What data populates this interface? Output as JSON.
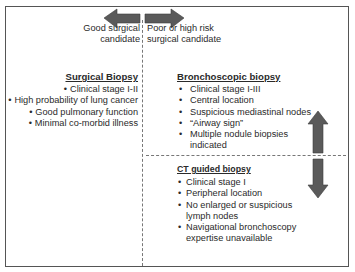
{
  "diagram": {
    "top_axis": {
      "left_label": "Good surgical candidate",
      "left_label_lines": [
        "Good surgical",
        "candidate"
      ],
      "right_label": "Poor or high risk surgical candidate",
      "right_label_lines": [
        "Poor or high risk",
        "surgical candidate"
      ],
      "arrow": "double-headed-horizontal"
    },
    "sections": {
      "surgical": {
        "title": "Surgical Biopsy",
        "items": [
          "Clinical stage I-II",
          "High probability of lung cancer",
          "Good pulmonary function",
          "Minimal co-morbid illness"
        ]
      },
      "bronchoscopic": {
        "title": "Bronchoscopic biopsy",
        "items": [
          "Clinical stage I-III",
          "Central location",
          "Suspicious mediastinal nodes",
          "“Airway sign”",
          "Multiple nodule biopsies indicated"
        ]
      },
      "ct_guided": {
        "title": "CT guided biopsy",
        "items": [
          "Clinical stage I",
          "Peripheral location",
          "No enlarged or suspicious lymph nodes",
          "Navigational bronchoscopy expertise unavailable"
        ]
      }
    },
    "bullet": "•",
    "colors": {
      "arrow_fill": "#5a5a5a",
      "frame": "#555555",
      "dashes": "#777777",
      "text": "#2a2a2a"
    }
  }
}
